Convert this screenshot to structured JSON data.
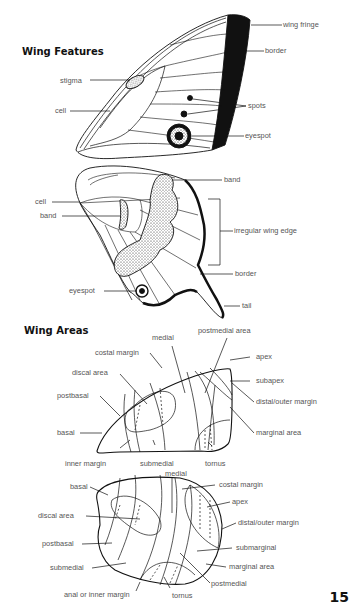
{
  "headings": {
    "wing_features": "Wing Features",
    "wing_areas": "Wing Areas"
  },
  "page_number": "15",
  "forewing_features": {
    "wing_fringe": "wing fringe",
    "border": "border",
    "stigma": "stigma",
    "cell": "cell",
    "spots": "spots",
    "eyespot": "eyespot"
  },
  "hindwing_features": {
    "band_top": "band",
    "cell": "cell",
    "band_left": "band",
    "irregular_wing_edge": "irregular wing edge",
    "border": "border",
    "eyespot": "eyespot",
    "tail": "tail"
  },
  "forewing_areas": {
    "medial": "medial",
    "postmedial_area": "postmedial area",
    "costal_margin": "costal margin",
    "apex": "apex",
    "discal_area": "discal area",
    "subapex": "subapex",
    "postbasal": "postbasal",
    "distal_outer_margin": "distal/outer margin",
    "basal": "basal",
    "marginal_area": "marginal area",
    "inner_margin": "inner margin",
    "submedial": "submedial",
    "tornus": "tornus"
  },
  "hindwing_areas": {
    "medial": "medial",
    "basal": "basal",
    "costal_margin": "costal margin",
    "apex": "apex",
    "discal_area": "discal area",
    "distal_outer_margin": "distal/outer margin",
    "postbasal": "postbasal",
    "submarginal": "submarginal",
    "submedial": "submedial",
    "marginal_area": "marginal area",
    "postmedial": "postmedial",
    "anal_or_inner_margin": "anal or inner margin",
    "tornus": "tornus"
  },
  "colors": {
    "ink": "#111111",
    "label": "#555555",
    "background": "#ffffff"
  }
}
